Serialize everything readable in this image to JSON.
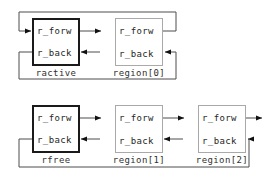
{
  "diagram": {
    "background_color": "#ffffff",
    "line_color": "#4d4d4d",
    "arrow_color": "#111111",
    "thick_border_color": "#1a1a1a",
    "thin_border_color": "#a9a9a9",
    "text_color": "#262626",
    "field_labels": {
      "forward": "r_forw",
      "backward": "r_back"
    },
    "groups": [
      {
        "id": "active-list",
        "nodes": [
          {
            "id": "ractive",
            "label": "ractive",
            "emphasis": "thick",
            "fields": [
              "r_forw",
              "r_back"
            ]
          },
          {
            "id": "region0",
            "label": "region[0]",
            "emphasis": "thin",
            "fields": [
              "r_forw",
              "r_back"
            ]
          }
        ]
      },
      {
        "id": "free-list",
        "nodes": [
          {
            "id": "rfree",
            "label": "rfree",
            "emphasis": "thick",
            "fields": [
              "r_forw",
              "r_back"
            ]
          },
          {
            "id": "region1",
            "label": "region[1]",
            "emphasis": "thin",
            "fields": [
              "r_forw",
              "r_back"
            ]
          },
          {
            "id": "region2",
            "label": "region[2]",
            "emphasis": "thin",
            "fields": [
              "r_forw",
              "r_back"
            ]
          }
        ]
      }
    ]
  }
}
